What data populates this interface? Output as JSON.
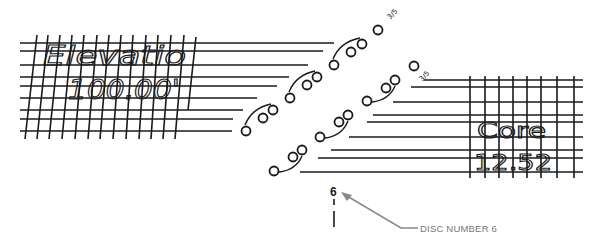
{
  "diagram": {
    "colors": {
      "ink": "#1a1a1a",
      "callout": "#888888",
      "callout_text": "#777777",
      "background": "#ffffff"
    },
    "left_label": {
      "line1": "Elevatio",
      "line2": "100.00'"
    },
    "right_label": {
      "line1": "Core",
      "line2": "12.52"
    },
    "fraction_labels": [
      "3/5",
      "3/5"
    ],
    "disc_marker": {
      "number": "6"
    },
    "callout": {
      "label": "DISC NUMBER 6"
    },
    "upper_disc_track": {
      "groups": [
        {
          "discs": [
            [
              246,
              131
            ],
            [
              263,
              118
            ],
            [
              273,
              110
            ]
          ]
        },
        {
          "discs": [
            [
              290,
              98
            ],
            [
              307,
              85
            ],
            [
              317,
              77
            ]
          ]
        },
        {
          "discs": [
            [
              334,
              65
            ],
            [
              351,
              52
            ],
            [
              362,
              44
            ]
          ]
        }
      ],
      "single": [
        378,
        30
      ]
    },
    "lower_disc_track": {
      "groups": [
        {
          "discs": [
            [
              274,
              171
            ],
            [
              293,
              157
            ],
            [
              302,
              150
            ]
          ]
        },
        {
          "discs": [
            [
              320,
              137
            ],
            [
              339,
              122
            ],
            [
              348,
              115
            ]
          ]
        },
        {
          "discs": [
            [
              367,
              101
            ],
            [
              386,
              88
            ],
            [
              395,
              80
            ]
          ]
        }
      ],
      "single": [
        414,
        66
      ]
    }
  }
}
